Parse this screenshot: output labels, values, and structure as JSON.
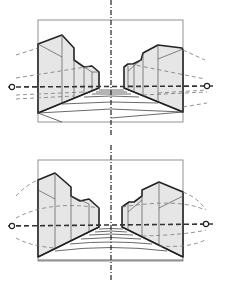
{
  "figures": [
    {
      "id": "top",
      "description": "One-point perspective street view with straight converging guide lines",
      "horizon_style": "straight",
      "floor_lines": "straight",
      "vanishing_points": [
        {
          "label": "left-vanishing-point",
          "x": 12,
          "y": 87
        },
        {
          "label": "right-vanishing-point",
          "x": 207,
          "y": 87
        }
      ]
    },
    {
      "id": "bottom",
      "description": "Curvilinear perspective street view with curved guide lines",
      "horizon_style": "straight",
      "floor_lines": "curved",
      "vanishing_points": [
        {
          "label": "left-vanishing-point",
          "x": 12,
          "y": 86
        },
        {
          "label": "right-vanishing-point",
          "x": 206,
          "y": 86
        }
      ]
    }
  ],
  "colors": {
    "building_fill": "#e6e6e6",
    "outline": "#222222",
    "guide": "#777777"
  }
}
